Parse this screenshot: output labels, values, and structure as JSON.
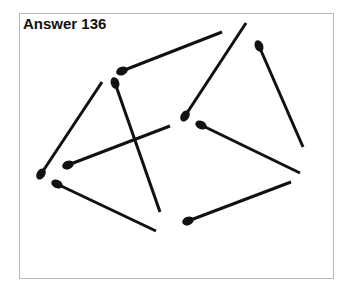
{
  "title": "Answer 136",
  "colors": {
    "stick": "#111111",
    "frame": "#b8b8b8",
    "background": "#ffffff"
  },
  "matches": [
    {
      "head": [
        122,
        71
      ],
      "tail": [
        222,
        32
      ]
    },
    {
      "head": [
        41,
        174
      ],
      "tail": [
        102,
        82
      ]
    },
    {
      "head": [
        185,
        116
      ],
      "tail": [
        246,
        23
      ]
    },
    {
      "head": [
        259,
        46
      ],
      "tail": [
        303,
        147
      ]
    },
    {
      "head": [
        115,
        83
      ],
      "tail": [
        160,
        212
      ]
    },
    {
      "head": [
        68,
        165
      ],
      "tail": [
        170,
        126
      ]
    },
    {
      "head": [
        201,
        125
      ],
      "tail": [
        300,
        173
      ]
    },
    {
      "head": [
        57,
        184
      ],
      "tail": [
        156,
        231
      ]
    },
    {
      "head": [
        188,
        221
      ],
      "tail": [
        291,
        182
      ]
    }
  ]
}
